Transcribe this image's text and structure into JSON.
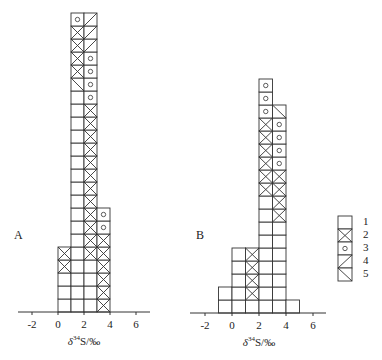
{
  "chart_data": {
    "type": "bar",
    "subtype": "stacked-cell-histogram",
    "title": "",
    "legend": {
      "position": "right",
      "entries": [
        {
          "id": 1,
          "label": "1",
          "pattern": "empty"
        },
        {
          "id": 2,
          "label": "2",
          "pattern": "cross"
        },
        {
          "id": 3,
          "label": "3",
          "pattern": "circle"
        },
        {
          "id": 4,
          "label": "4",
          "pattern": "diagonal-up"
        },
        {
          "id": 5,
          "label": "5",
          "pattern": "diagonal-down"
        }
      ]
    },
    "panels": [
      {
        "label": "A",
        "xlabel_prefix": "δ",
        "xlabel_sup": "34",
        "xlabel_rest": "S/‰",
        "xlim": [
          -3,
          7
        ],
        "xticks": [
          -2,
          0,
          2,
          4,
          6
        ],
        "bin_width": 1,
        "bins": [
          {
            "range": [
              0,
              1
            ],
            "count": 5,
            "stack_bottom_up": [
              1,
              1,
              1,
              2,
              2
            ]
          },
          {
            "range": [
              1,
              2
            ],
            "count": 23,
            "stack_bottom_up": [
              1,
              1,
              1,
              1,
              1,
              1,
              1,
              1,
              1,
              1,
              1,
              1,
              1,
              1,
              1,
              1,
              1,
              5,
              2,
              2,
              2,
              2,
              3
            ]
          },
          {
            "range": [
              2,
              3
            ],
            "count": 23,
            "stack_bottom_up": [
              1,
              1,
              1,
              1,
              2,
              2,
              2,
              2,
              2,
              2,
              2,
              2,
              2,
              2,
              2,
              2,
              3,
              3,
              3,
              3,
              4,
              4,
              4
            ]
          },
          {
            "range": [
              3,
              4
            ],
            "count": 8,
            "stack_bottom_up": [
              2,
              2,
              2,
              2,
              2,
              2,
              3,
              3
            ]
          }
        ]
      },
      {
        "label": "B",
        "xlabel_prefix": "δ",
        "xlabel_sup": "34",
        "xlabel_rest": "S/‰",
        "xlim": [
          -3,
          7
        ],
        "xticks": [
          -2,
          0,
          2,
          4,
          6
        ],
        "bin_width": 1,
        "bins": [
          {
            "range": [
              -1,
              0
            ],
            "count": 2,
            "stack_bottom_up": [
              1,
              1
            ]
          },
          {
            "range": [
              0,
              1
            ],
            "count": 5,
            "stack_bottom_up": [
              1,
              1,
              1,
              1,
              1
            ]
          },
          {
            "range": [
              1,
              2
            ],
            "count": 5,
            "stack_bottom_up": [
              1,
              2,
              2,
              2,
              2
            ]
          },
          {
            "range": [
              2,
              3
            ],
            "count": 18,
            "stack_bottom_up": [
              1,
              1,
              1,
              1,
              1,
              1,
              1,
              1,
              1,
              2,
              2,
              2,
              2,
              2,
              2,
              3,
              3,
              3
            ]
          },
          {
            "range": [
              3,
              4
            ],
            "count": 16,
            "stack_bottom_up": [
              1,
              1,
              1,
              1,
              1,
              1,
              1,
              2,
              2,
              2,
              2,
              3,
              3,
              3,
              3,
              5
            ]
          },
          {
            "range": [
              4,
              5
            ],
            "count": 1,
            "stack_bottom_up": [
              1
            ]
          }
        ]
      }
    ]
  },
  "layout": {
    "cell": 13,
    "panels": [
      {
        "zero_x": 58,
        "unit_px": 13,
        "baseline_y": 312,
        "axis_x0": 18,
        "axis_x1": 150,
        "label_x": 14,
        "label_y": 228
      },
      {
        "zero_x": 232,
        "unit_px": 13.5,
        "baseline_y": 313,
        "axis_x0": 190,
        "axis_x1": 326,
        "label_x": 196,
        "label_y": 228
      }
    ],
    "legend": {
      "x": 338,
      "y": 216,
      "w": 14,
      "h": 13,
      "label_x": 363
    }
  }
}
